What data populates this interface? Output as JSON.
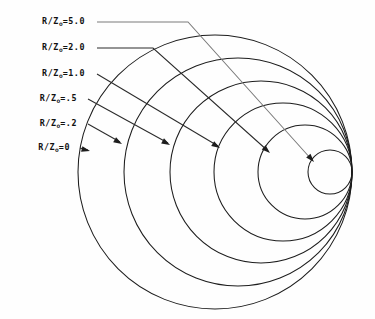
{
  "figure": {
    "background_color": "#fefefe",
    "line_color": "#1d1d1d",
    "faint_line_color": "#7b7b7b",
    "width": 375,
    "height": 319
  },
  "labels": [
    {
      "id": "r5",
      "prefix": "R/Z",
      "subscript": "o",
      "value": "=5.0",
      "full": "R/Zₒ=5.0",
      "x": 85,
      "y": 22
    },
    {
      "id": "r2",
      "prefix": "R/Z",
      "subscript": "o",
      "value": "=2.0",
      "full": "R/Zₒ=2.0",
      "x": 85,
      "y": 48
    },
    {
      "id": "r1",
      "prefix": "R/Z",
      "subscript": "o",
      "value": "=1.0",
      "full": "R/Zₒ=1.0",
      "x": 85,
      "y": 74
    },
    {
      "id": "r05",
      "prefix": "R/Z",
      "subscript": "o",
      "value": "=.5",
      "full": "R/Zₒ=.5",
      "x": 77,
      "y": 99
    },
    {
      "id": "r02",
      "prefix": "R/Z",
      "subscript": "o",
      "value": "=.2",
      "full": "R/Zₒ=.2",
      "x": 77,
      "y": 124
    },
    {
      "id": "r0",
      "prefix": "R/Z",
      "subscript": "o",
      "value": "=0",
      "full": "R/Zₒ=0",
      "x": 70,
      "y": 148
    }
  ],
  "chart_data": {
    "type": "line",
    "xlabel": "",
    "ylabel": "",
    "grid": false,
    "legend_position": "left-leader-labels",
    "tangent_point": {
      "x": 352,
      "y": 172
    },
    "series": [
      {
        "name": "R/Zₒ=0",
        "value": 0.0,
        "center_x": 215,
        "center_y": 172,
        "radius": 137
      },
      {
        "name": "R/Zₒ=.2",
        "value": 0.2,
        "center_x": 238,
        "center_y": 172,
        "radius": 114
      },
      {
        "name": "R/Zₒ=.5",
        "value": 0.5,
        "center_x": 261,
        "center_y": 172,
        "radius": 91
      },
      {
        "name": "R/Zₒ=1.0",
        "value": 1.0,
        "center_x": 283,
        "center_y": 172,
        "radius": 69
      },
      {
        "name": "R/Zₒ=2.0",
        "value": 2.0,
        "center_x": 305,
        "center_y": 172,
        "radius": 47
      },
      {
        "name": "R/Zₒ=5.0",
        "value": 5.0,
        "center_x": 330,
        "center_y": 172,
        "radius": 22
      }
    ]
  },
  "leaders": [
    {
      "id": "leader-r5",
      "for": "R/Zₒ=5.0",
      "faint": true,
      "points": "97,22 188,22 312,160",
      "arrow_tip": {
        "x": 314,
        "y": 162
      },
      "arrow_angle": 48
    },
    {
      "id": "leader-r2",
      "for": "R/Zₒ=2.0",
      "faint": false,
      "points": "97,48 153,48 268,151",
      "arrow_tip": {
        "x": 270,
        "y": 153
      },
      "arrow_angle": 42
    },
    {
      "id": "leader-r1",
      "for": "R/Zₒ=1.0",
      "faint": false,
      "points": "97,74 218,146",
      "arrow_tip": {
        "x": 220,
        "y": 148
      },
      "arrow_angle": 31
    },
    {
      "id": "leader-r05",
      "for": "R/Zₒ=.5",
      "faint": false,
      "points": "88,99 168,143",
      "arrow_tip": {
        "x": 170,
        "y": 145
      },
      "arrow_angle": 29
    },
    {
      "id": "leader-r02",
      "for": "R/Zₒ=.2",
      "faint": false,
      "points": "88,124 120,142",
      "arrow_tip": {
        "x": 122,
        "y": 144
      },
      "arrow_angle": 30
    },
    {
      "id": "leader-r0",
      "for": "R/Zₒ=0",
      "faint": false,
      "points": "80,148 88,150",
      "arrow_tip": {
        "x": 90,
        "y": 151
      },
      "arrow_angle": 14
    }
  ]
}
